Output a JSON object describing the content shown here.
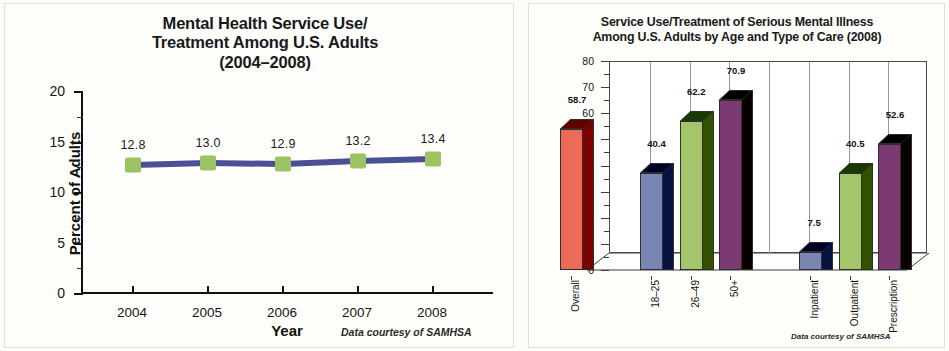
{
  "left_panel": {
    "title": "Mental Health Service Use/\nTreatment Among U.S. Adults\n(2004–2008)",
    "title_lines": [
      "Mental Health Service Use/",
      "Treatment Among U.S. Adults",
      "(2004–2008)"
    ],
    "credit": "Data courtesy of SAMHSA"
  },
  "right_panel": {
    "title_lines": [
      "Service Use/Treatment of Serious Mental Illness",
      "Among U.S. Adults by Age and Type of Care (2008)"
    ],
    "credit": "Data courtesy of SAMHSA"
  },
  "colors": {
    "marker_green": "#9cc362",
    "line_blue": "#4a4f97",
    "bar_red": "#ee6a58",
    "bar_red_side": "#8e2a2c",
    "bar_blue": "#7a86b2",
    "bar_blue_side": "#2f2f55",
    "bar_green": "#a5c56a",
    "bar_green_side": "#3a3a22",
    "bar_purple": "#7c3a72",
    "bar_purple_side": "#4a1f46",
    "panel_border": "#e2e0cf",
    "axis": "#111111"
  },
  "chart_data": [
    {
      "type": "line",
      "title": "Mental Health Service Use/ Treatment Among U.S. Adults (2004–2008)",
      "xlabel": "Year",
      "ylabel": "Percent of Adults",
      "categories": [
        "2004",
        "2005",
        "2006",
        "2007",
        "2008"
      ],
      "values": [
        12.8,
        13.0,
        12.9,
        13.2,
        13.4
      ],
      "data_labels": [
        "12.8",
        "13.0",
        "12.9",
        "13.2",
        "13.4"
      ],
      "ylim": [
        0,
        20
      ],
      "yticks": [
        0,
        5,
        10,
        15,
        20
      ],
      "ytick_labels": [
        "0",
        "5",
        "10",
        "15",
        "20"
      ],
      "grid": false,
      "legend": "none",
      "marker": "square",
      "series_color": "#4a4f97",
      "marker_color": "#9cc362",
      "annotation": "Data courtesy of SAMHSA"
    },
    {
      "type": "bar",
      "title": "Service Use/Treatment of Serious Mental Illness Among U.S. Adults by Age and Type of Care (2008)",
      "xlabel": "",
      "ylabel": "Percent",
      "categories": [
        "Overall",
        "18–25",
        "26–49",
        "50+",
        "Inpatient",
        "Outpatient",
        "Prescription"
      ],
      "values": [
        58.7,
        40.4,
        62.2,
        70.9,
        7.5,
        40.5,
        52.6
      ],
      "data_labels": [
        "58.7",
        "40.4",
        "62.2",
        "70.9",
        "7.5",
        "40.5",
        "52.6"
      ],
      "bar_colors": [
        "#ee6a58",
        "#7a86b2",
        "#a5c56a",
        "#7c3a72",
        "#7a86b2",
        "#a5c56a",
        "#7c3a72"
      ],
      "ylim": [
        0,
        80
      ],
      "yticks": [
        0,
        10,
        20,
        30,
        40,
        50,
        60,
        70,
        80
      ],
      "ytick_labels": [
        "0",
        "10",
        "20",
        "30",
        "40",
        "50",
        "60",
        "70",
        "80"
      ],
      "grid": true,
      "grid_axis": "x",
      "legend": "none",
      "style": "3d",
      "annotation": "Data courtesy of SAMHSA"
    }
  ]
}
